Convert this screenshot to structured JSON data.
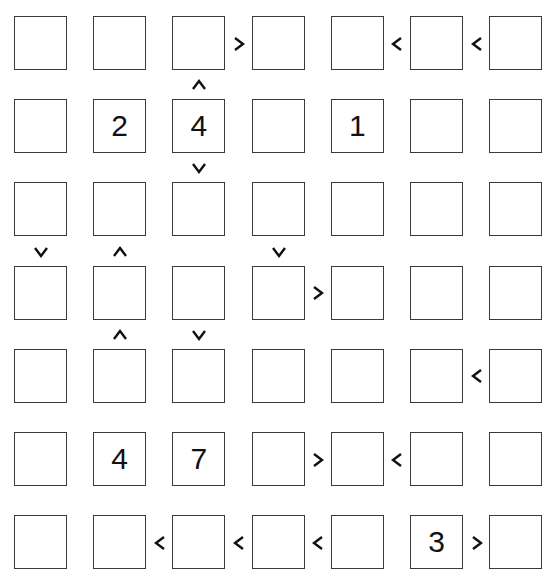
{
  "puzzle": {
    "type": "futoshiki",
    "size": 7,
    "givens": [
      [
        null,
        null,
        null,
        null,
        null,
        null,
        null
      ],
      [
        null,
        "2",
        "4",
        null,
        "1",
        null,
        null
      ],
      [
        null,
        null,
        null,
        null,
        null,
        null,
        null
      ],
      [
        null,
        null,
        null,
        null,
        null,
        null,
        null
      ],
      [
        null,
        null,
        null,
        null,
        null,
        null,
        null
      ],
      [
        null,
        "4",
        "7",
        null,
        null,
        null,
        null
      ],
      [
        null,
        null,
        null,
        null,
        null,
        "3",
        null
      ]
    ],
    "horizontal_signs": [
      {
        "row": 0,
        "col": 2,
        "sign": ">"
      },
      {
        "row": 0,
        "col": 4,
        "sign": "<"
      },
      {
        "row": 0,
        "col": 5,
        "sign": "<"
      },
      {
        "row": 3,
        "col": 3,
        "sign": ">"
      },
      {
        "row": 4,
        "col": 5,
        "sign": "<"
      },
      {
        "row": 5,
        "col": 3,
        "sign": ">"
      },
      {
        "row": 5,
        "col": 4,
        "sign": "<"
      },
      {
        "row": 6,
        "col": 1,
        "sign": "<"
      },
      {
        "row": 6,
        "col": 2,
        "sign": "<"
      },
      {
        "row": 6,
        "col": 3,
        "sign": "<"
      },
      {
        "row": 6,
        "col": 5,
        "sign": ">"
      }
    ],
    "vertical_signs": [
      {
        "row": 0,
        "col": 2,
        "sign": "^"
      },
      {
        "row": 1,
        "col": 2,
        "sign": "v"
      },
      {
        "row": 2,
        "col": 0,
        "sign": "v"
      },
      {
        "row": 2,
        "col": 1,
        "sign": "^"
      },
      {
        "row": 2,
        "col": 3,
        "sign": "v"
      },
      {
        "row": 3,
        "col": 1,
        "sign": "^"
      },
      {
        "row": 3,
        "col": 2,
        "sign": "v"
      }
    ]
  }
}
